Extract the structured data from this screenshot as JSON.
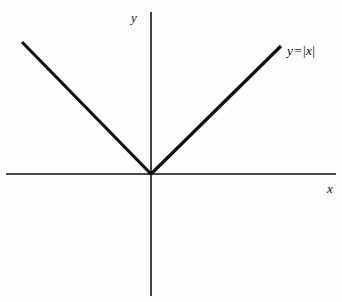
{
  "figure": {
    "background_color": "#fefefe",
    "width": 342,
    "height": 302,
    "ink_color": "#111111"
  },
  "axes": {
    "x_axis": {
      "label": "x",
      "label_position": {
        "x": 333,
        "y": 189
      },
      "line": {
        "x1": 6,
        "y1": 174,
        "x2": 336,
        "y2": 174
      },
      "stroke_width": 1.6
    },
    "y_axis": {
      "label": "y",
      "label_position": {
        "x": 139,
        "y": 18
      },
      "line": {
        "x1": 151,
        "y1": 12,
        "x2": 151,
        "y2": 296
      },
      "stroke_width": 1.6
    },
    "origin": {
      "x": 151,
      "y": 174
    }
  },
  "curve": {
    "label_full": "y = |x|",
    "label_parts": {
      "y": "y",
      "equals": "=",
      "bar_open": "|",
      "x": "x",
      "bar_close": "|"
    },
    "stroke_width": 3.2,
    "left_ray": {
      "x1": 22,
      "y1": 42,
      "x2": 151,
      "y2": 174
    },
    "right_ray": {
      "x1": 151,
      "y1": 174,
      "x2": 281,
      "y2": 46
    }
  },
  "chart_data": {
    "type": "line",
    "title": "",
    "subtitle": "",
    "xlabel": "x",
    "ylabel": "y",
    "grid": false,
    "legend_position": "inline-right",
    "annotations": [
      {
        "text": "y = |x|",
        "x": 130,
        "y": 128,
        "anchor": "left"
      }
    ],
    "axis_style": "cartesian-cross",
    "xlim": [
      -145,
      185
    ],
    "ylim": [
      -122,
      162
    ],
    "series": [
      {
        "name": "y = |x|",
        "x": [
          -129,
          -96.75,
          -64.5,
          -32.25,
          0,
          32.5,
          65,
          97.5,
          130
        ],
        "values": [
          132,
          99,
          66,
          33,
          0,
          32,
          64,
          96,
          128
        ]
      }
    ]
  }
}
